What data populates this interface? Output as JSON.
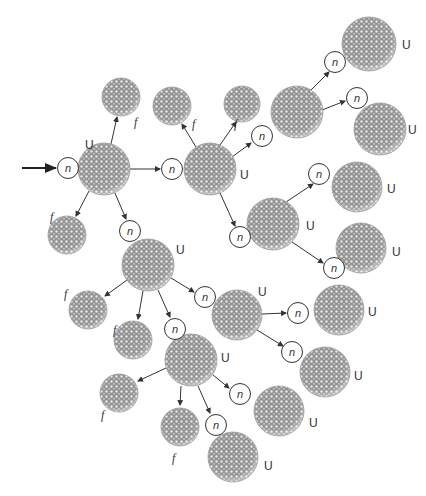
{
  "diagram": {
    "type": "nuclear-chain-reaction",
    "labels": {
      "neutron": "n",
      "uranium": "U",
      "fragment": "f"
    },
    "colors": {
      "sphere_fill": "#9a9a9a",
      "sphere_dots": "#e8e8e8",
      "line": "#333333",
      "neutron_stroke": "#333333"
    },
    "input_arrow": {
      "x1": 22,
      "y1": 168,
      "x2": 56,
      "y2": 168
    },
    "neutrons": [
      {
        "id": "n0",
        "x": 68,
        "y": 168
      },
      {
        "id": "n1",
        "x": 172,
        "y": 169
      },
      {
        "id": "n2",
        "x": 130,
        "y": 231
      },
      {
        "id": "n3",
        "x": 262,
        "y": 136
      },
      {
        "id": "n4",
        "x": 240,
        "y": 237
      },
      {
        "id": "n5",
        "x": 335,
        "y": 62
      },
      {
        "id": "n6",
        "x": 357,
        "y": 98
      },
      {
        "id": "n7",
        "x": 319,
        "y": 174
      },
      {
        "id": "n8",
        "x": 334,
        "y": 268
      },
      {
        "id": "n9",
        "x": 205,
        "y": 297
      },
      {
        "id": "n10",
        "x": 175,
        "y": 329
      },
      {
        "id": "n11",
        "x": 298,
        "y": 313
      },
      {
        "id": "n12",
        "x": 292,
        "y": 352
      },
      {
        "id": "n13",
        "x": 240,
        "y": 394
      },
      {
        "id": "n14",
        "x": 216,
        "y": 425
      }
    ],
    "uranium": [
      {
        "id": "U0",
        "x": 104,
        "y": 169,
        "r": 26,
        "lx": 85,
        "ly": 149
      },
      {
        "id": "U1",
        "x": 210,
        "y": 169,
        "r": 26,
        "lx": 240,
        "ly": 179
      },
      {
        "id": "U2",
        "x": 297,
        "y": 112,
        "r": 26,
        "lx": null,
        "ly": null
      },
      {
        "id": "U3",
        "x": 369,
        "y": 44,
        "r": 27,
        "lx": 402,
        "ly": 49
      },
      {
        "id": "U4",
        "x": 380,
        "y": 129,
        "r": 26,
        "lx": 408,
        "ly": 134
      },
      {
        "id": "U5",
        "x": 273,
        "y": 224,
        "r": 26,
        "lx": 306,
        "ly": 230
      },
      {
        "id": "U6",
        "x": 357,
        "y": 187,
        "r": 25,
        "lx": 387,
        "ly": 193
      },
      {
        "id": "U7",
        "x": 361,
        "y": 248,
        "r": 25,
        "lx": 392,
        "ly": 256
      },
      {
        "id": "U8",
        "x": 148,
        "y": 265,
        "r": 26,
        "lx": 176,
        "ly": 254
      },
      {
        "id": "U9",
        "x": 237,
        "y": 315,
        "r": 25,
        "lx": 258,
        "ly": 296
      },
      {
        "id": "U10",
        "x": 339,
        "y": 310,
        "r": 25,
        "lx": 368,
        "ly": 316
      },
      {
        "id": "U11",
        "x": 325,
        "y": 372,
        "r": 25,
        "lx": 354,
        "ly": 380
      },
      {
        "id": "U12",
        "x": 191,
        "y": 360,
        "r": 26,
        "lx": 221,
        "ly": 362
      },
      {
        "id": "U13",
        "x": 279,
        "y": 411,
        "r": 25,
        "lx": 309,
        "ly": 427
      },
      {
        "id": "U14",
        "x": 233,
        "y": 457,
        "r": 25,
        "lx": 264,
        "ly": 470
      }
    ],
    "fragments": [
      {
        "id": "f0",
        "x": 121,
        "y": 97,
        "r": 19,
        "lx": 134,
        "ly": 126
      },
      {
        "id": "f1",
        "x": 67,
        "y": 235,
        "r": 19,
        "lx": 50,
        "ly": 221
      },
      {
        "id": "f2",
        "x": 172,
        "y": 106,
        "r": 19,
        "lx": 192,
        "ly": 128
      },
      {
        "id": "f3",
        "x": 242,
        "y": 104,
        "r": 18,
        "lx": 234,
        "ly": 128
      },
      {
        "id": "f4",
        "x": 88,
        "y": 310,
        "r": 19,
        "lx": 64,
        "ly": 298
      },
      {
        "id": "f5",
        "x": 133,
        "y": 340,
        "r": 19,
        "lx": 113,
        "ly": 334
      },
      {
        "id": "f6",
        "x": 119,
        "y": 393,
        "r": 19,
        "lx": 101,
        "ly": 419
      },
      {
        "id": "f7",
        "x": 180,
        "y": 427,
        "r": 19,
        "lx": 172,
        "ly": 462
      }
    ],
    "arrows": [
      {
        "x1": 80,
        "y1": 168,
        "x2": 78,
        "y2": 168,
        "skip": true
      },
      {
        "x1": 130,
        "y1": 169,
        "x2": 160,
        "y2": 169
      },
      {
        "x1": 111,
        "y1": 144,
        "x2": 117,
        "y2": 117
      },
      {
        "x1": 89,
        "y1": 191,
        "x2": 76,
        "y2": 216
      },
      {
        "x1": 115,
        "y1": 193,
        "x2": 126,
        "y2": 219
      },
      {
        "x1": 196,
        "y1": 147,
        "x2": 182,
        "y2": 124
      },
      {
        "x1": 220,
        "y1": 145,
        "x2": 236,
        "y2": 122
      },
      {
        "x1": 232,
        "y1": 157,
        "x2": 251,
        "y2": 143
      },
      {
        "x1": 220,
        "y1": 193,
        "x2": 235,
        "y2": 226
      },
      {
        "x1": 311,
        "y1": 90,
        "x2": 329,
        "y2": 72
      },
      {
        "x1": 322,
        "y1": 110,
        "x2": 345,
        "y2": 101
      },
      {
        "x1": 286,
        "y1": 202,
        "x2": 313,
        "y2": 184
      },
      {
        "x1": 292,
        "y1": 242,
        "x2": 323,
        "y2": 263
      },
      {
        "x1": 127,
        "y1": 280,
        "x2": 105,
        "y2": 296
      },
      {
        "x1": 143,
        "y1": 291,
        "x2": 138,
        "y2": 319
      },
      {
        "x1": 158,
        "y1": 290,
        "x2": 170,
        "y2": 317
      },
      {
        "x1": 171,
        "y1": 278,
        "x2": 194,
        "y2": 292
      },
      {
        "x1": 262,
        "y1": 314,
        "x2": 286,
        "y2": 313
      },
      {
        "x1": 257,
        "y1": 330,
        "x2": 283,
        "y2": 346
      },
      {
        "x1": 166,
        "y1": 368,
        "x2": 138,
        "y2": 381
      },
      {
        "x1": 181,
        "y1": 386,
        "x2": 180,
        "y2": 405
      },
      {
        "x1": 198,
        "y1": 386,
        "x2": 210,
        "y2": 413
      },
      {
        "x1": 213,
        "y1": 375,
        "x2": 229,
        "y2": 388
      }
    ]
  }
}
